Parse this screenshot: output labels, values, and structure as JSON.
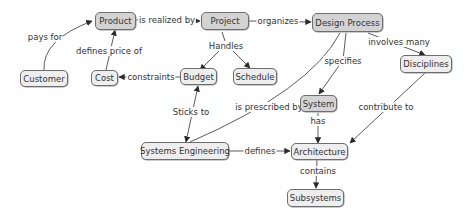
{
  "diagram": {
    "type": "concept-map",
    "colors": {
      "node_dark_fill": "#d3d3d3",
      "node_light_fill": "#eeeeee",
      "node_border": "#6e6e6e",
      "edge": "#3c3c3c",
      "text": "#333333"
    },
    "nodes": [
      {
        "id": "product",
        "label": "Product",
        "style": "dark"
      },
      {
        "id": "project",
        "label": "Project",
        "style": "dark"
      },
      {
        "id": "design_process",
        "label": "Design Process",
        "style": "dark"
      },
      {
        "id": "customer",
        "label": "Customer",
        "style": "light"
      },
      {
        "id": "cost",
        "label": "Cost",
        "style": "light"
      },
      {
        "id": "budget",
        "label": "Budget",
        "style": "light"
      },
      {
        "id": "schedule",
        "label": "Schedule",
        "style": "light"
      },
      {
        "id": "disciplines",
        "label": "Disciplines",
        "style": "light"
      },
      {
        "id": "system",
        "label": "System",
        "style": "dark"
      },
      {
        "id": "systems_engineering",
        "label": "Systems Engineering",
        "style": "light"
      },
      {
        "id": "architecture",
        "label": "Architecture",
        "style": "light"
      },
      {
        "id": "subsystems",
        "label": "Subsystems",
        "style": "light"
      }
    ],
    "edges": [
      {
        "from": "customer",
        "to": "product",
        "label": "pays for"
      },
      {
        "from": "product",
        "to": "project",
        "label": "is realized by"
      },
      {
        "from": "project",
        "to": "design_process",
        "label": "organizes"
      },
      {
        "from": "cost",
        "to": "product",
        "label": "defines price of"
      },
      {
        "from": "project",
        "to": "budget",
        "label": "Handles"
      },
      {
        "from": "project",
        "to": "schedule",
        "label": "Handles"
      },
      {
        "from": "budget",
        "to": "cost",
        "label": "constraints"
      },
      {
        "from": "design_process",
        "to": "disciplines",
        "label": "involves many"
      },
      {
        "from": "design_process",
        "to": "system",
        "label": "specifies"
      },
      {
        "from": "design_process",
        "to": "systems_engineering",
        "label": "is prescribed by"
      },
      {
        "from": "systems_engineering",
        "to": "budget",
        "label": "Sticks to"
      },
      {
        "from": "system",
        "to": "architecture",
        "label": "has"
      },
      {
        "from": "disciplines",
        "to": "architecture",
        "label": "contribute to"
      },
      {
        "from": "systems_engineering",
        "to": "architecture",
        "label": "defines"
      },
      {
        "from": "architecture",
        "to": "subsystems",
        "label": "contains"
      }
    ],
    "edge_labels": {
      "pays_for": "pays for",
      "is_realized_by": "is realized by",
      "organizes": "organizes",
      "defines_price_of": "defines price of",
      "handles": "Handles",
      "constraints": "constraints",
      "involves_many": "involves many",
      "specifies": "specifies",
      "is_prescribed_by": "is prescribed by",
      "sticks_to": "Sticks to",
      "has": "has",
      "contribute_to": "contribute to",
      "defines": "defines",
      "contains": "contains"
    }
  }
}
